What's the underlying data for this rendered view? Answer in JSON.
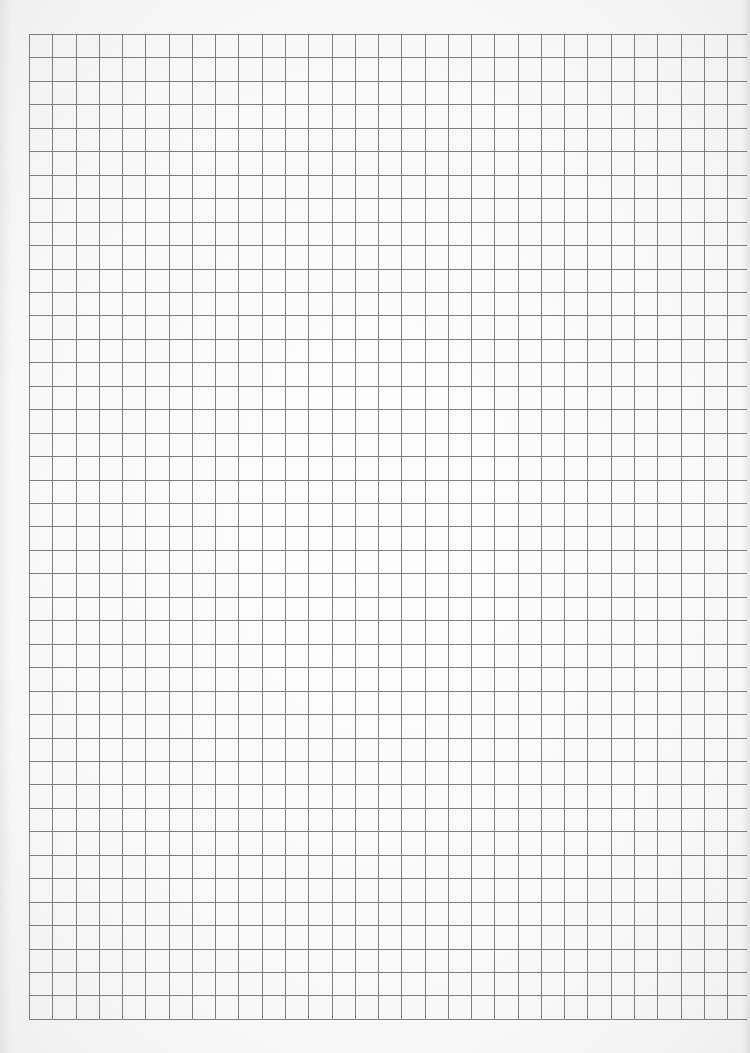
{
  "sheet": {
    "type": "grid-paper",
    "grid": {
      "left": 29,
      "top": 34,
      "columns": 30,
      "rows": 42,
      "cell_width": 23.27,
      "cell_height": 23.45,
      "horizontal_overhang_right": 20
    },
    "colors": {
      "paper": "#fafafa",
      "line": "#6b6b6b"
    }
  }
}
